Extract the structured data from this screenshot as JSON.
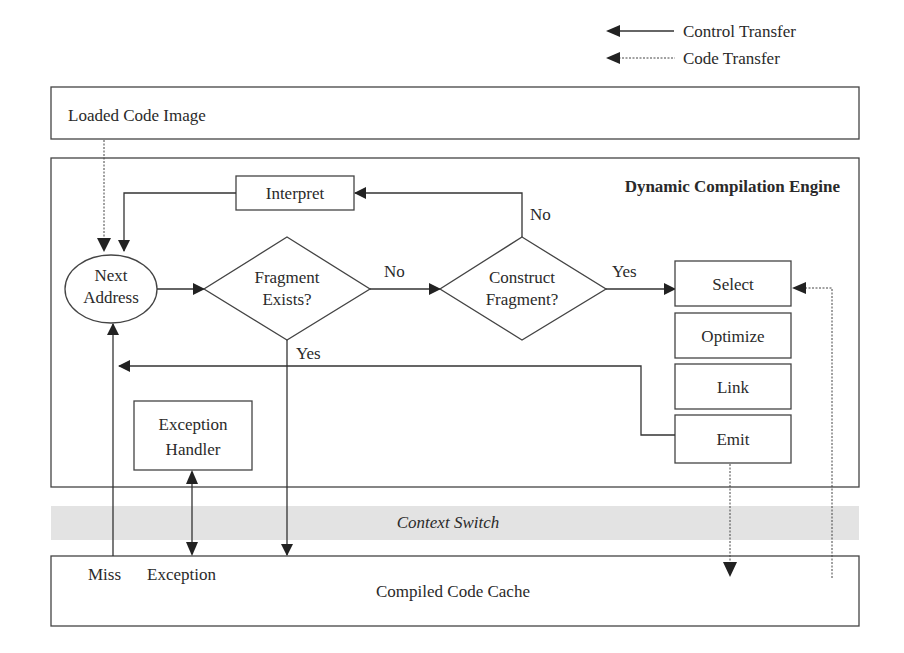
{
  "legend": {
    "control_transfer": "Control Transfer",
    "code_transfer": "Code Transfer"
  },
  "blocks": {
    "loaded_code_image": "Loaded Code Image",
    "engine_title": "Dynamic Compilation Engine",
    "interpret": "Interpret",
    "next_address_line1": "Next",
    "next_address_line2": "Address",
    "fragment_exists_line1": "Fragment",
    "fragment_exists_line2": "Exists?",
    "construct_fragment_line1": "Construct",
    "construct_fragment_line2": "Fragment?",
    "select": "Select",
    "optimize": "Optimize",
    "link": "Link",
    "emit": "Emit",
    "exception_handler_line1": "Exception",
    "exception_handler_line2": "Handler",
    "context_switch": "Context Switch",
    "compiled_code_cache": "Compiled Code Cache"
  },
  "edge_labels": {
    "no_fragment": "No",
    "yes_fragment": "Yes",
    "no_construct": "No",
    "yes_construct": "Yes",
    "miss": "Miss",
    "exception": "Exception"
  },
  "colors": {
    "context_band": "#e3e3e3",
    "stroke": "#444444"
  }
}
